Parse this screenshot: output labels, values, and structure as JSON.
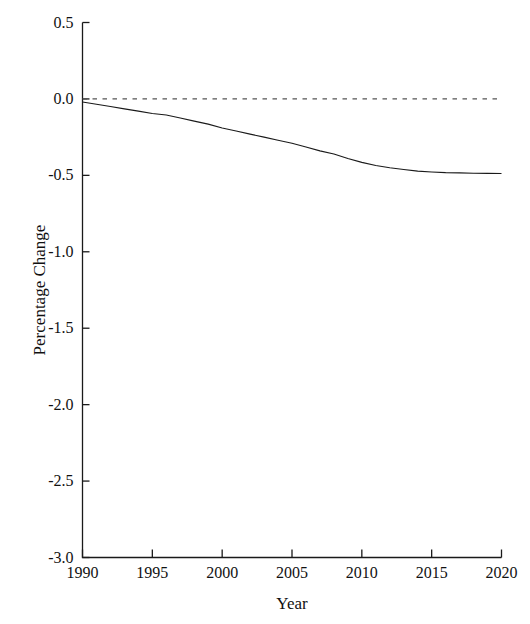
{
  "chart_data": {
    "type": "line",
    "title": "",
    "xlabel": "Year",
    "ylabel": "Percentage Change",
    "xlim": [
      1990,
      2020
    ],
    "ylim": [
      -3.0,
      0.5
    ],
    "grid": false,
    "legend": null,
    "xticks": [
      1990,
      1995,
      2000,
      2005,
      2010,
      2015,
      2020
    ],
    "xtick_labels": [
      "1990",
      "1995",
      "2000",
      "2005",
      "2010",
      "2015",
      "2020"
    ],
    "yticks": [
      0.5,
      0.0,
      -0.5,
      -1.0,
      -1.5,
      -2.0,
      -2.5,
      -3.0
    ],
    "ytick_labels": [
      "0.5",
      "0.0",
      "-0.5",
      "-1.0",
      "-1.5",
      "-2.0",
      "-2.5",
      "-3.0"
    ],
    "series": [
      {
        "name": "zero-reference",
        "style": "dashed",
        "color": "#555555",
        "x": [
          1990,
          2020
        ],
        "values": [
          0.0,
          0.0
        ]
      },
      {
        "name": "percentage-change",
        "style": "solid",
        "color": "#1a1a1a",
        "x": [
          1990,
          1991,
          1992,
          1993,
          1994,
          1995,
          1996,
          1997,
          1998,
          1999,
          2000,
          2001,
          2002,
          2003,
          2004,
          2005,
          2006,
          2007,
          2008,
          2009,
          2010,
          2011,
          2012,
          2013,
          2014,
          2015,
          2016,
          2017,
          2018,
          2019,
          2020
        ],
        "values": [
          -0.02,
          -0.035,
          -0.05,
          -0.065,
          -0.08,
          -0.095,
          -0.105,
          -0.125,
          -0.145,
          -0.165,
          -0.19,
          -0.21,
          -0.23,
          -0.25,
          -0.27,
          -0.29,
          -0.315,
          -0.34,
          -0.36,
          -0.39,
          -0.415,
          -0.435,
          -0.45,
          -0.462,
          -0.472,
          -0.478,
          -0.482,
          -0.484,
          -0.486,
          -0.487,
          -0.488
        ]
      }
    ]
  },
  "axes": {
    "x_axis_name": "x-axis",
    "y_axis_name": "y-axis"
  }
}
